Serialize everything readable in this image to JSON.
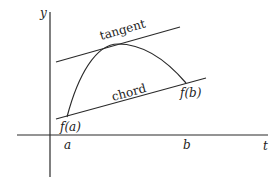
{
  "diagram": {
    "type": "mean-value-theorem",
    "colors": {
      "background": "#ffffff",
      "stroke": "#2a2a2a",
      "text": "#222222"
    },
    "axes": {
      "y_label": "y",
      "x_label": "t"
    },
    "ticks": {
      "a_label": "a",
      "b_label": "b"
    },
    "points": {
      "fa_label": "f(a)",
      "fb_label": "f(b)"
    },
    "lines": {
      "tangent_label": "tangent",
      "chord_label": "chord"
    }
  }
}
